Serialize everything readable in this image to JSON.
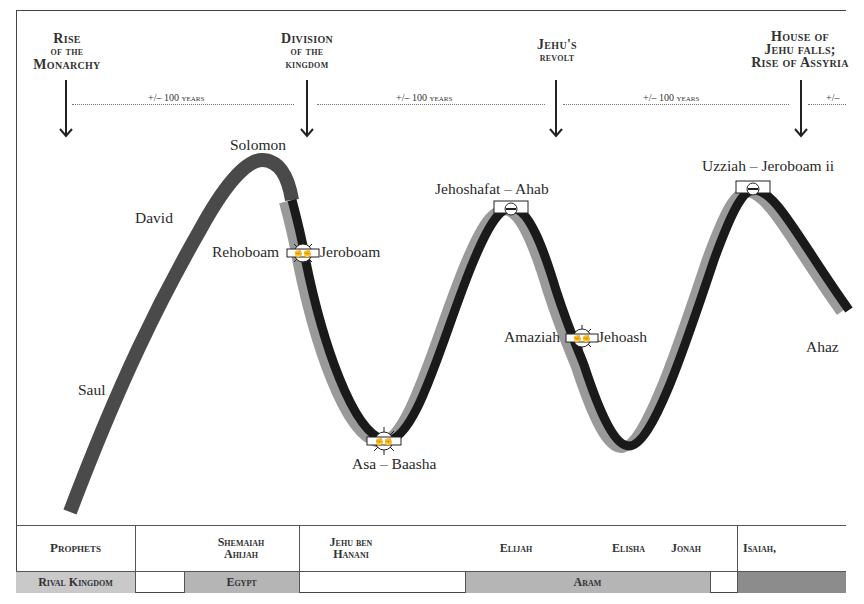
{
  "events": [
    {
      "id": "rise-monarchy",
      "lines": [
        "Rise",
        "of the",
        "Monarchy"
      ]
    },
    {
      "id": "division-kingdom",
      "lines": [
        "Division",
        "of the",
        "kingdom"
      ]
    },
    {
      "id": "jehu-revolt",
      "lines": [
        "Jehu's",
        "revolt"
      ]
    },
    {
      "id": "house-jehu-falls",
      "lines": [
        "House of",
        "Jehu falls;",
        "Rise of Assyria"
      ]
    }
  ],
  "intervals": [
    {
      "label": "+/– 100 years"
    },
    {
      "label": "+/– 100 years"
    },
    {
      "label": "+/– 100 years"
    },
    {
      "label": "+/–"
    }
  ],
  "kings": {
    "saul": "Saul",
    "david": "David",
    "solomon": "Solomon",
    "rehoboam": "Rehoboam",
    "jeroboam": "Jeroboam",
    "asa_baasha": "Asa – Baasha",
    "jehoshafat_ahab": "Jehoshafat – Ahab",
    "amaziah": "Amaziah",
    "jehoash": "Jehoash",
    "uzziah_jeroboam2": "Uzziah – Jeroboam ii",
    "ahaz": "Ahaz"
  },
  "curve": {
    "united_color": "#4a4a4a",
    "judah_color": "#9a9a9a",
    "israel_color": "#1a1a1a"
  },
  "table": {
    "prophets_header": "Prophets",
    "rival_header": "Rival Kingdom",
    "prophets": {
      "shemaiah_ahijah": [
        "Shemaiah",
        "Ahijah"
      ],
      "jehu_ben_hanani": [
        "Jehu ben",
        "Hanani"
      ],
      "elijah": "Elijah",
      "elisha": "Elisha",
      "jonah": "Jonah",
      "isaiah": "Isaiah,"
    },
    "rivals": {
      "egypt": "Egypt",
      "aram": "Aram",
      "assyria": ""
    }
  }
}
